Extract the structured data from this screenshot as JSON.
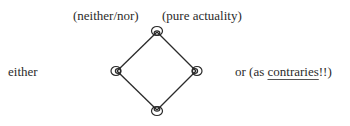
{
  "diagram": {
    "type": "diamond-lattice",
    "labels": {
      "top_left": "(neither/nor)",
      "top_right": "(pure actuality)",
      "left": "either",
      "right_prefix": "or (as ",
      "right_underlined": "contraries",
      "right_suffix": "!!)"
    },
    "nodes": [
      {
        "id": "top",
        "x": 157,
        "y": 32
      },
      {
        "id": "left",
        "x": 117,
        "y": 71
      },
      {
        "id": "right",
        "x": 196,
        "y": 71
      },
      {
        "id": "bottom",
        "x": 157,
        "y": 110
      }
    ],
    "edges": [
      [
        "top",
        "left"
      ],
      [
        "top",
        "right"
      ],
      [
        "left",
        "bottom"
      ],
      [
        "right",
        "bottom"
      ]
    ],
    "colors": {
      "line": "#2a2a2a",
      "text": "#2b2b2b",
      "background": "#ffffff"
    }
  }
}
